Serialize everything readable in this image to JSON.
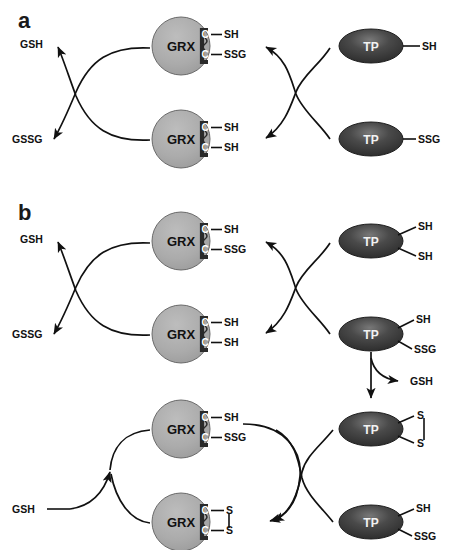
{
  "figure": {
    "panels": [
      {
        "id": "a",
        "letter": "a"
      },
      {
        "id": "b",
        "letter": "b"
      }
    ]
  },
  "labels": {
    "gsh": "GSH",
    "gssg": "GSSG",
    "grx": "GRX",
    "tp": "TP",
    "cys": "C",
    "sh": "SH",
    "ssg": "SSG",
    "s": "S"
  },
  "colors": {
    "grx_fill": "#a8a8a8",
    "grx_stroke": "#4d4d4d",
    "tp_fill": "#3a3a3a",
    "tp_highlight": "#6e6e6e",
    "line": "#111111",
    "bracket": "#2a2a2a",
    "background": "#ffffff",
    "text_dark": "#111111",
    "text_light": "#ffffff"
  },
  "panel_a": {
    "letter": "a",
    "left_species": [
      {
        "name": "gsh-label",
        "text": "GSH"
      },
      {
        "name": "gssg-label",
        "text": "GSSG"
      }
    ],
    "grx_nodes": [
      {
        "name": "grx-a-top",
        "text": "GRX",
        "cys": [
          {
            "residue": "C",
            "group": "SH"
          },
          {
            "residue": "C",
            "group": "SSG"
          }
        ],
        "disulfide": false
      },
      {
        "name": "grx-a-bottom",
        "text": "GRX",
        "cys": [
          {
            "residue": "C",
            "group": "SH"
          },
          {
            "residue": "C",
            "group": "SH"
          }
        ],
        "disulfide": false
      }
    ],
    "tp_nodes": [
      {
        "name": "tp-a-top",
        "text": "TP",
        "groups": [
          "SH"
        ],
        "disulfide": false
      },
      {
        "name": "tp-a-bottom",
        "text": "TP",
        "groups": [
          "SSG"
        ],
        "disulfide": false
      }
    ]
  },
  "panel_b": {
    "letter": "b",
    "left_species": [
      {
        "name": "gsh-label",
        "text": "GSH"
      },
      {
        "name": "gssg-label",
        "text": "GSSG"
      },
      {
        "name": "gsh-input-label",
        "text": "GSH"
      }
    ],
    "released": {
      "name": "gsh-released-label",
      "text": "GSH"
    },
    "grx_nodes": [
      {
        "name": "grx-b-1",
        "text": "GRX",
        "cys": [
          {
            "residue": "C",
            "group": "SH"
          },
          {
            "residue": "C",
            "group": "SSG"
          }
        ],
        "disulfide": false
      },
      {
        "name": "grx-b-2",
        "text": "GRX",
        "cys": [
          {
            "residue": "C",
            "group": "SH"
          },
          {
            "residue": "C",
            "group": "SH"
          }
        ],
        "disulfide": false
      },
      {
        "name": "grx-b-3",
        "text": "GRX",
        "cys": [
          {
            "residue": "C",
            "group": "SH"
          },
          {
            "residue": "C",
            "group": "SSG"
          }
        ],
        "disulfide": false
      },
      {
        "name": "grx-b-4",
        "text": "GRX",
        "cys": [
          {
            "residue": "C",
            "group": "S"
          },
          {
            "residue": "C",
            "group": "S"
          }
        ],
        "disulfide": true
      }
    ],
    "tp_nodes": [
      {
        "name": "tp-b-1",
        "text": "TP",
        "groups": [
          "SH",
          "SH"
        ],
        "disulfide": false
      },
      {
        "name": "tp-b-2",
        "text": "TP",
        "groups": [
          "SH",
          "SSG"
        ],
        "disulfide": false
      },
      {
        "name": "tp-b-3",
        "text": "TP",
        "groups": [
          "S",
          "S"
        ],
        "disulfide": true
      },
      {
        "name": "tp-b-4",
        "text": "TP",
        "groups": [
          "SH",
          "SSG"
        ],
        "disulfide": false
      }
    ]
  }
}
